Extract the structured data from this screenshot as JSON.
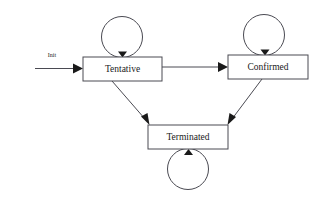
{
  "diagram": {
    "background_color": "#ffffff",
    "line_color": "#4a4a52",
    "text_color": "#1a1a1a",
    "states": [
      {
        "id": "tentative",
        "label": "Tentative",
        "x": 83,
        "y": 57,
        "width": 79,
        "height": 24,
        "has_self_loop": true,
        "self_loop_position": "top"
      },
      {
        "id": "confirmed",
        "label": "Confirmed",
        "x": 228,
        "y": 55,
        "width": 80,
        "height": 24,
        "has_self_loop": true,
        "self_loop_position": "top"
      },
      {
        "id": "terminated",
        "label": "Terminated",
        "x": 148,
        "y": 125,
        "width": 80,
        "height": 24,
        "has_self_loop": true,
        "self_loop_position": "bottom"
      }
    ],
    "transitions": [
      {
        "id": "init-to-tentative",
        "label": "Init",
        "from": "start",
        "to": "tentative",
        "kind": "straight"
      },
      {
        "id": "tentative-to-confirmed",
        "label": "",
        "from": "tentative",
        "to": "confirmed",
        "kind": "straight"
      },
      {
        "id": "tentative-to-terminated",
        "label": "",
        "from": "tentative",
        "to": "terminated",
        "kind": "diagonal"
      },
      {
        "id": "confirmed-to-terminated",
        "label": "",
        "from": "confirmed",
        "to": "terminated",
        "kind": "diagonal"
      },
      {
        "id": "tentative-self",
        "label": "",
        "from": "tentative",
        "to": "tentative",
        "kind": "self-loop"
      },
      {
        "id": "confirmed-self",
        "label": "",
        "from": "confirmed",
        "to": "confirmed",
        "kind": "self-loop"
      },
      {
        "id": "terminated-self",
        "label": "",
        "from": "terminated",
        "to": "terminated",
        "kind": "self-loop"
      }
    ]
  }
}
